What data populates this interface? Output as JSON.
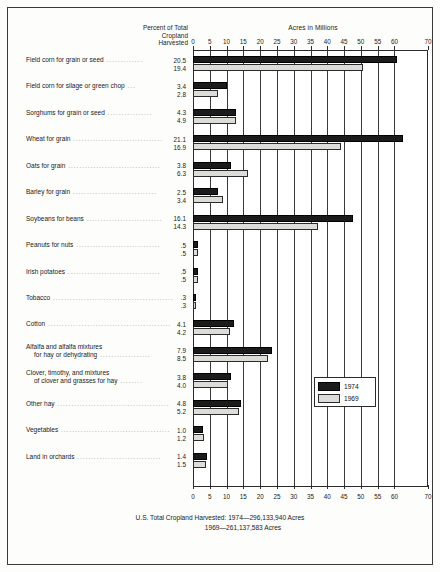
{
  "header": {
    "percent_header_lines": [
      "Percent of Total",
      "Cropland",
      "Harvested"
    ],
    "acres_header": "Acres in Millions"
  },
  "legend": {
    "items": [
      {
        "label": "1974",
        "color": "#1b1b1b"
      },
      {
        "label": "1969",
        "color": "#dcdcd8"
      }
    ]
  },
  "footer": {
    "line1": "U.S. Total Cropland Harvested:  1974—296,133,940 Acres",
    "line2": "1969—261,137,583 Acres"
  },
  "chart_data": {
    "type": "bar",
    "orientation": "horizontal",
    "title": "",
    "xlabel": "Acres in Millions",
    "ylabel": "",
    "xlim": [
      0,
      70
    ],
    "xticks": [
      0,
      5,
      10,
      15,
      20,
      25,
      30,
      35,
      40,
      45,
      50,
      55,
      60,
      70
    ],
    "grid": true,
    "legend_position": "inside-right",
    "series": [
      {
        "name": "1974",
        "color": "#1b1b1b"
      },
      {
        "name": "1969",
        "color": "#dcdcd8"
      }
    ],
    "categories": [
      "Field corn for grain or seed",
      "Field corn for silage or green chop",
      "Sorghums for grain or seed",
      "Wheat for grain",
      "Oats for grain",
      "Barley for grain",
      "Soybeans for beans",
      "Peanuts for nuts",
      "Irish potatoes",
      "Tobacco",
      "Cotton",
      "Alfalfa and alfalfa mixtures for hay or dehydrating",
      "Clover, timothy, and mixtures of clover and grasses for hay",
      "Other hay",
      "Vegetables",
      "Land in orchards"
    ],
    "category_label_lines": [
      [
        "Field corn for grain or seed"
      ],
      [
        "Field corn for silage or green chop"
      ],
      [
        "Sorghums for grain or seed"
      ],
      [
        "Wheat for grain"
      ],
      [
        "Oats for grain"
      ],
      [
        "Barley for grain"
      ],
      [
        "Soybeans for beans"
      ],
      [
        "Peanuts for nuts"
      ],
      [
        "Irish potatoes"
      ],
      [
        "Tobacco"
      ],
      [
        "Cotton"
      ],
      [
        "Alfalfa and alfalfa mixtures",
        "for hay or dehydrating"
      ],
      [
        "Clover, timothy, and mixtures",
        "of clover and grasses for hay"
      ],
      [
        "Other hay"
      ],
      [
        "Vegetables"
      ],
      [
        "Land in orchards"
      ]
    ],
    "percent_labels_1974": [
      "20.5",
      "3.4",
      "4.3",
      "21.1",
      "3.8",
      "2.5",
      "16.1",
      ".5",
      ".5",
      ".3",
      "4.1",
      "7.9",
      "3.8",
      "4.8",
      "1.0",
      "1.4"
    ],
    "percent_labels_1969": [
      "19.4",
      "2.8",
      "4.9",
      "16.9",
      "6.3",
      "3.4",
      "14.3",
      ".5",
      ".5",
      ".3",
      "4.2",
      "8.5",
      "4.0",
      "5.2",
      "1.2",
      "1.5"
    ],
    "acres_1974": [
      60.7,
      10.1,
      12.7,
      62.5,
      11.3,
      7.4,
      47.7,
      1.5,
      1.4,
      0.9,
      12.1,
      23.4,
      11.3,
      14.2,
      3.0,
      4.1
    ],
    "acres_1969": [
      50.7,
      7.3,
      12.8,
      44.1,
      16.5,
      8.9,
      37.3,
      1.4,
      1.4,
      0.9,
      11.0,
      22.2,
      10.4,
      13.6,
      3.2,
      3.9
    ]
  }
}
